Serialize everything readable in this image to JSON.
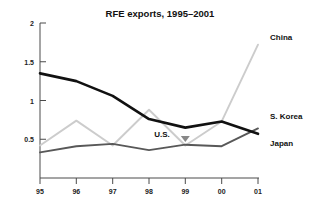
{
  "chart_data": {
    "type": "line",
    "title": "RFE exports, 1995–2001",
    "xlabel": "",
    "ylabel": "",
    "x": [
      "95",
      "96",
      "97",
      "98",
      "99",
      "00",
      "01"
    ],
    "xtick_labels": [
      "95",
      "96",
      "97",
      "98",
      "99",
      "00",
      "01"
    ],
    "ytick_labels": [
      "0.5",
      "1",
      "1.5",
      "2"
    ],
    "ytick_values": [
      0.5,
      1,
      1.5,
      2
    ],
    "ylim": [
      0,
      2
    ],
    "grid": false,
    "legend_position": "right-inline-labels",
    "series": [
      {
        "name": "Japan",
        "color": "#111111",
        "values": [
          1.35,
          1.25,
          1.06,
          0.76,
          0.65,
          0.73,
          0.57
        ]
      },
      {
        "name": "S. Korea",
        "color": "#585858",
        "values": [
          0.33,
          0.41,
          0.44,
          0.36,
          0.43,
          0.41,
          0.64
        ]
      },
      {
        "name": "China",
        "color": "#cccccc",
        "values": [
          0.42,
          0.74,
          0.42,
          0.88,
          0.42,
          0.73,
          1.72
        ]
      }
    ],
    "annotations": [
      {
        "text": "U.S.",
        "x_value": "99",
        "y_value": 0.44,
        "marker": "down-arrow"
      }
    ]
  },
  "labels": {
    "china": "China",
    "s_korea": "S. Korea",
    "japan": "Japan",
    "us": "U.S."
  },
  "axis": {
    "y": {
      "t0": "2",
      "t1": "1.5",
      "t2": "1",
      "t3": "0.5"
    },
    "x": {
      "t0": "95",
      "t1": "96",
      "t2": "97",
      "t3": "98",
      "t4": "99",
      "t5": "00",
      "t6": "01"
    }
  }
}
